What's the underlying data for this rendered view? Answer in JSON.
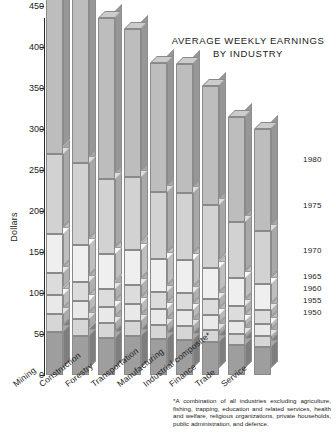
{
  "title": {
    "line1": "AVERAGE WEEKLY EARNINGS",
    "line2": "BY INDUSTRY"
  },
  "axis": {
    "ylabel": "Dollars",
    "yticks": [
      "0",
      "50",
      "100",
      "150",
      "200",
      "250",
      "300",
      "350",
      "400",
      "450"
    ]
  },
  "footnote": {
    "text": "*A combination of all industries excluding agriculture, fishing, trapping, education and related services, health and welfare, religious organizations, private households, public administration, and defence."
  },
  "chart_data": {
    "type": "bar",
    "title": "AVERAGE WEEKLY EARNINGS BY INDUSTRY",
    "subtype": "stacked-3d-column",
    "xlabel": "",
    "ylabel": "Dollars",
    "ylim": [
      0,
      480
    ],
    "grid": false,
    "legend_position": "right",
    "categories": [
      "Mining",
      "Construction",
      "Forestry",
      "Transportation",
      "Manufacturing",
      "Industrial composite*",
      "Finance",
      "Trade",
      "Service"
    ],
    "series": [
      {
        "name": "1950",
        "values": [
          52,
          48,
          45,
          47,
          44,
          43,
          40,
          36,
          34
        ]
      },
      {
        "name": "1955",
        "values": [
          22,
          20,
          18,
          19,
          17,
          17,
          15,
          14,
          13
        ]
      },
      {
        "name": "1960",
        "values": [
          24,
          22,
          20,
          21,
          19,
          19,
          18,
          16,
          15
        ]
      },
      {
        "name": "1965",
        "values": [
          26,
          24,
          22,
          23,
          21,
          21,
          20,
          18,
          17
        ]
      },
      {
        "name": "1970",
        "values": [
          48,
          45,
          42,
          43,
          40,
          40,
          38,
          34,
          32
        ]
      },
      {
        "name": "1975",
        "values": [
          98,
          100,
          92,
          88,
          82,
          82,
          76,
          68,
          65
        ]
      },
      {
        "name": "1980",
        "values": [
          193,
          213,
          196,
          181,
          157,
          157,
          145,
          129,
          124
        ]
      }
    ],
    "totals": [
      463,
      472,
      435,
      422,
      380,
      379,
      352,
      315,
      300
    ],
    "legend_entries": [
      "1980",
      "1975",
      "1970",
      "1965",
      "1960",
      "1955",
      "1950"
    ]
  },
  "years": [
    {
      "label": "1980"
    },
    {
      "label": "1975"
    },
    {
      "label": "1970"
    },
    {
      "label": "1965"
    },
    {
      "label": "1960"
    },
    {
      "label": "1955"
    },
    {
      "label": "1950"
    }
  ],
  "industries": [
    {
      "label": "Mining"
    },
    {
      "label": "Construction"
    },
    {
      "label": "Forestry"
    },
    {
      "label": "Transportation"
    },
    {
      "label": "Manufacturing"
    },
    {
      "label": "Industrial composite*"
    },
    {
      "label": "Finance"
    },
    {
      "label": "Trade"
    },
    {
      "label": "Service"
    }
  ],
  "colors": {
    "segment_1950": "#9e9e9e",
    "segment_1955": "#d6d6d6",
    "segment_1960": "#e9e9e9",
    "segment_1965": "#dcdcdc",
    "segment_1970": "#efefef",
    "segment_1975": "#d2d2d2",
    "segment_1980": "#bdbdbd",
    "axis": "#2b2b2b",
    "text": "#1b1b1b",
    "background": "#ffffff"
  }
}
